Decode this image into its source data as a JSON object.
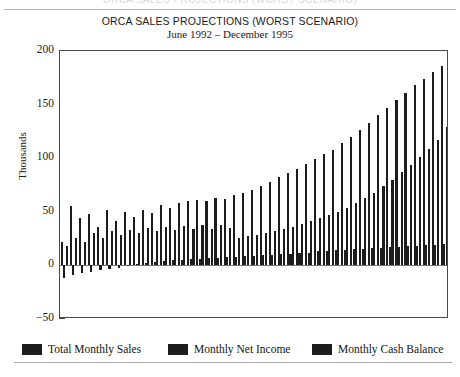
{
  "chart_data": {
    "type": "bar",
    "title": "ORCA SALES PROJECTIONS (WORST SCENARIO)",
    "subtitle": "June 1992 – December 1995",
    "xlabel": "",
    "ylabel": "Thousands",
    "ylim": [
      -50,
      200
    ],
    "yticks": [
      200,
      150,
      100,
      50,
      0,
      -50
    ],
    "ytick_labels": [
      "200",
      "150",
      "100",
      "50",
      "0",
      "−50"
    ],
    "grid": false,
    "legend_position": "below-plot",
    "bar_color": "#1c1c1c",
    "categories": [
      "Jun 1992",
      "Jul 1992",
      "Aug 1992",
      "Sep 1992",
      "Oct 1992",
      "Nov 1992",
      "Dec 1992",
      "Jan 1993",
      "Feb 1993",
      "Mar 1993",
      "Apr 1993",
      "May 1993",
      "Jun 1993",
      "Jul 1993",
      "Aug 1993",
      "Sep 1993",
      "Oct 1993",
      "Nov 1993",
      "Dec 1993",
      "Jan 1994",
      "Feb 1994",
      "Mar 1994",
      "Apr 1994",
      "May 1994",
      "Jun 1994",
      "Jul 1994",
      "Aug 1994",
      "Sep 1994",
      "Oct 1994",
      "Nov 1994",
      "Dec 1994",
      "Jan 1995",
      "Feb 1995",
      "Mar 1995",
      "Apr 1995",
      "May 1995",
      "Jun 1995",
      "Jul 1995",
      "Aug 1995",
      "Sep 1995",
      "Oct 1995",
      "Nov 1995",
      "Dec 1995"
    ],
    "series": [
      {
        "name": "Total Monthly Sales",
        "values": [
          22,
          55,
          44,
          48,
          36,
          52,
          41,
          50,
          45,
          52,
          49,
          56,
          54,
          58,
          60,
          61,
          60,
          63,
          62,
          66,
          68,
          70,
          74,
          78,
          82,
          86,
          90,
          95,
          99,
          104,
          108,
          114,
          120,
          126,
          133,
          140,
          147,
          154,
          161,
          168,
          174,
          180,
          186
        ]
      },
      {
        "name": "Monthly Net Income",
        "values": [
          -12,
          -9,
          -7,
          -6,
          -4,
          -3,
          -2,
          -1,
          1,
          2,
          3,
          4,
          5,
          5,
          6,
          6,
          7,
          7,
          8,
          8,
          9,
          9,
          10,
          10,
          11,
          11,
          12,
          12,
          13,
          13,
          14,
          14,
          15,
          15,
          16,
          16,
          17,
          17,
          18,
          18,
          19,
          19,
          20
        ]
      },
      {
        "name": "Monthly Cash Balance",
        "values": [
          18,
          26,
          22,
          30,
          26,
          32,
          28,
          33,
          30,
          35,
          32,
          36,
          33,
          37,
          34,
          38,
          34,
          38,
          35,
          26,
          27,
          28,
          30,
          32,
          34,
          36,
          39,
          41,
          44,
          47,
          50,
          54,
          58,
          63,
          68,
          74,
          80,
          87,
          94,
          101,
          109,
          117,
          129
        ]
      }
    ]
  },
  "legend": {
    "items": [
      {
        "label": "Total Monthly Sales"
      },
      {
        "label": "Monthly Net Income"
      },
      {
        "label": "Monthly Cash Balance"
      }
    ]
  },
  "header": {
    "clipped_text": "ORCA SALES PROJECTIONS (WORST SCENARIO)"
  }
}
